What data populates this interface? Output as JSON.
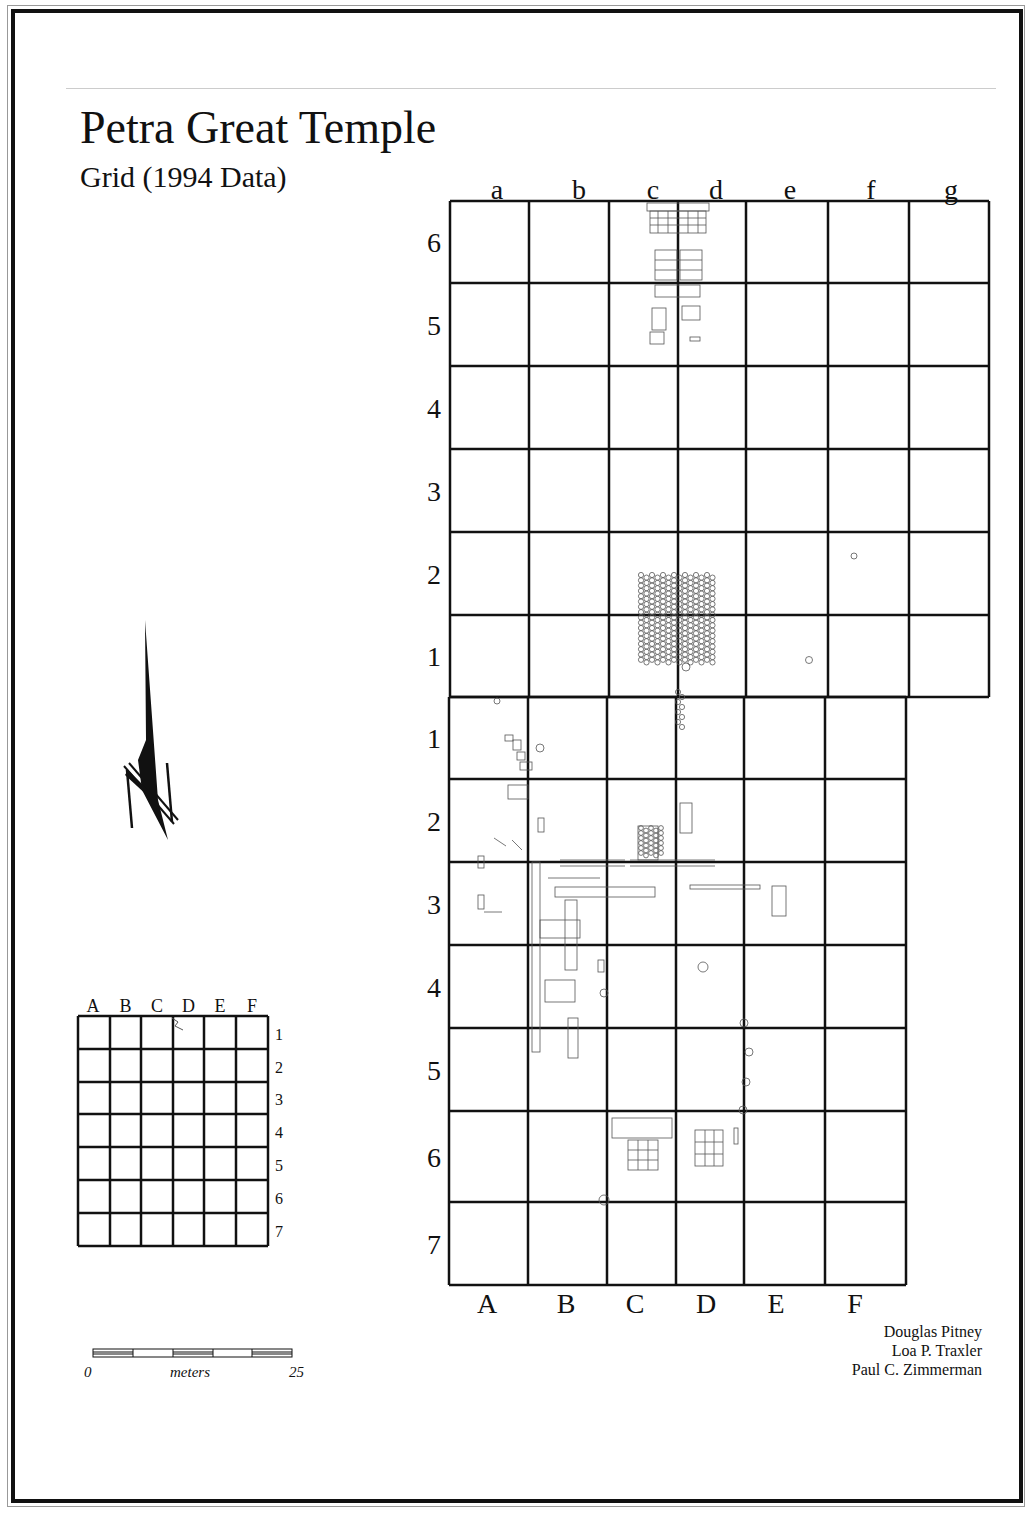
{
  "title": "Petra Great Temple",
  "subtitle": "Grid (1994 Data)",
  "credits": [
    "Douglas Pitney",
    "Loa P. Traxler",
    "Paul C. Zimmerman"
  ],
  "scale_bar": {
    "start_label": "0",
    "unit_label": "meters",
    "end_label": "25",
    "segments": 5
  },
  "north_arrow": {
    "label": "N",
    "icon": "north-arrow-icon"
  },
  "upper_grid": {
    "column_labels": [
      "a",
      "b",
      "c",
      "d",
      "e",
      "f",
      "g"
    ],
    "row_labels": [
      "6",
      "5",
      "4",
      "3",
      "2",
      "1"
    ],
    "column_lines_x": [
      450,
      529,
      609,
      678,
      746,
      828,
      909,
      989
    ],
    "row_lines_y": [
      201,
      283,
      366,
      449,
      532,
      615,
      697
    ]
  },
  "lower_grid": {
    "column_labels": [
      "A",
      "B",
      "C",
      "D",
      "E",
      "F"
    ],
    "row_labels": [
      "1",
      "2",
      "3",
      "4",
      "5",
      "6",
      "7"
    ],
    "column_lines_x": [
      449,
      528,
      607,
      676,
      744,
      825,
      906
    ],
    "row_lines_y": [
      697,
      779,
      862,
      945,
      1028,
      1111,
      1202,
      1285
    ]
  },
  "key_map": {
    "column_labels": [
      "A",
      "B",
      "C",
      "D",
      "E",
      "F"
    ],
    "row_labels": [
      "1",
      "2",
      "3",
      "4",
      "5",
      "6",
      "7"
    ]
  },
  "colors": {
    "ink": "#111111",
    "feature": "#555555",
    "frame_outer": "#999999",
    "rule": "#cccccc"
  }
}
